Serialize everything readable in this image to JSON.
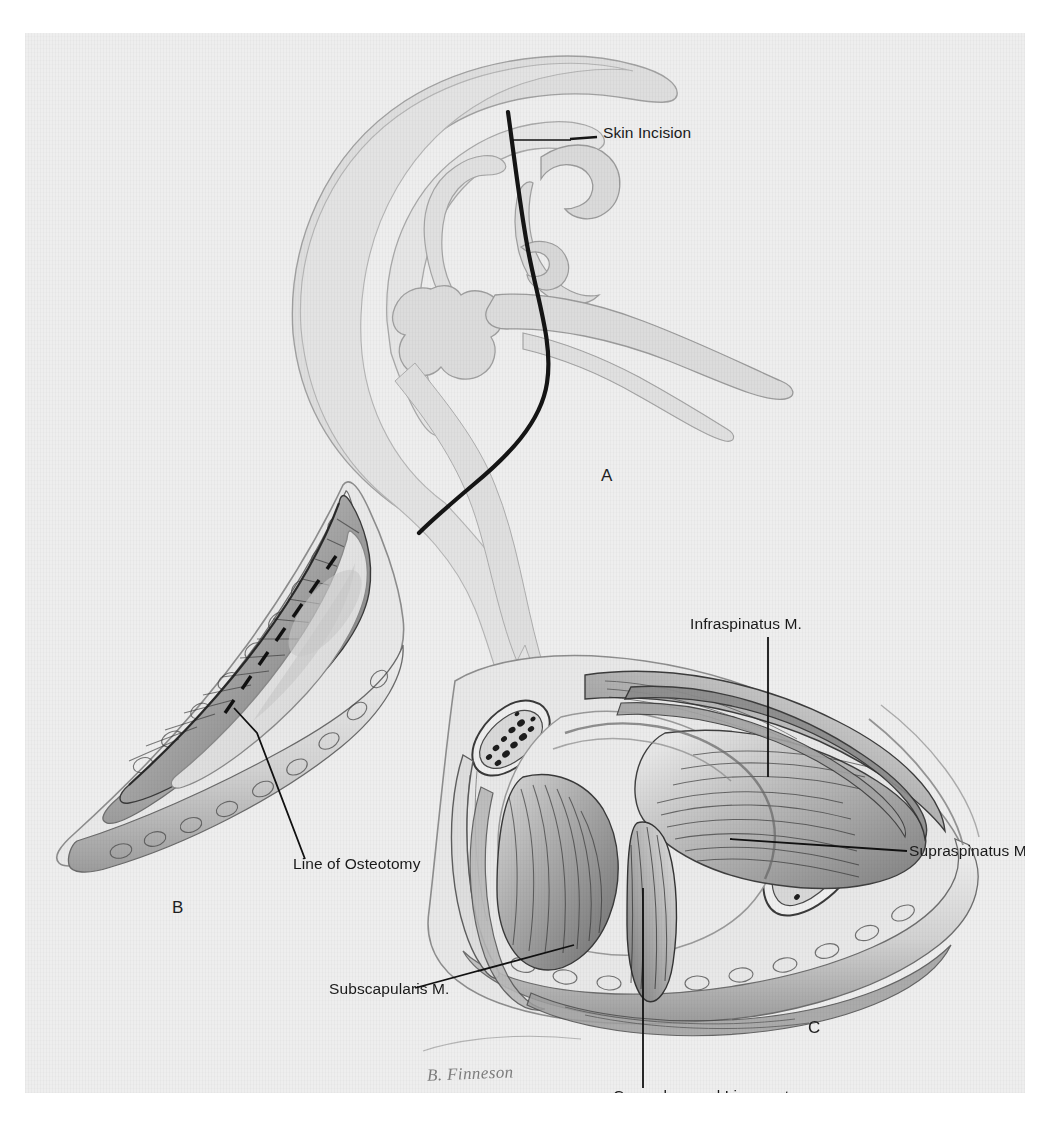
{
  "figure": {
    "medium": "halftone pen-and-wash medical illustration (scanned book plate)",
    "artist_signature": "B. Finneson",
    "background_hex": "#eeeeee",
    "ink_hex": "#1a1a1a",
    "page_hex": "#ffffff"
  },
  "panels": [
    {
      "letter": "A",
      "name": "panel-a",
      "description": "Lateral view of the shoulder girdle showing the scapula, acromion, clavicle and proximal humerus with the planned skin incision drawn as a bold curved line.",
      "labels": [
        {
          "text": "Skin Incision",
          "leader": "horizontal-with-tick"
        }
      ]
    },
    {
      "letter": "B",
      "name": "panel-b",
      "description": "Superficial dissection: the elliptical wound is retracted open, exposing muscle fibres; a dashed line marks the intended bone cut.",
      "labels": [
        {
          "text": "Line of Osteotomy",
          "leader": "bent-elbow"
        }
      ]
    },
    {
      "letter": "C",
      "name": "panel-c",
      "description": "Deep dissection after osteotomy: the two cut cancellous bone ends are visible and the rotator cuff musculature is exposed.",
      "labels": [
        {
          "text": "Infraspinatus M.",
          "leader": "vertical"
        },
        {
          "text": "Supraspinatus M.",
          "leader": "horizontal"
        },
        {
          "text": "Subscapularis M.",
          "leader": "diagonal"
        },
        {
          "text": "Coracohumeral Ligament",
          "leader": "vertical"
        }
      ]
    }
  ],
  "callouts": {
    "skin_incision": "Skin Incision",
    "line_of_osteotomy": "Line of Osteotomy",
    "infraspinatus": "Infraspinatus M.",
    "supraspinatus": "Supraspinatus M.",
    "subscapularis": "Subscapularis M.",
    "coracohumeral_ligament": "Coracohumeral Ligament"
  },
  "panel_letters": {
    "a": "A",
    "b": "B",
    "c": "C"
  },
  "signature": "B. Finneson",
  "caption": {
    "text": "",
    "note": "caption line is cropped off at the bottom edge of the scan and is illegible"
  }
}
